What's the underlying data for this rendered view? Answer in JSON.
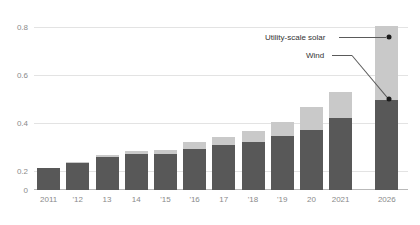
{
  "chart_data": {
    "type": "bar",
    "stacked": true,
    "title": "",
    "subtitle": "",
    "xlabel": "",
    "ylabel": "",
    "ylim": [
      0,
      0.9
    ],
    "yticks": [
      0,
      0.2,
      0.4,
      0.6,
      0.8
    ],
    "ytick_labels": [
      "0",
      "0.2",
      "0.4",
      "0.6",
      "0.8"
    ],
    "gridlines": [
      0.2,
      0.4,
      0.6,
      0.8
    ],
    "grid": true,
    "legend_position": "annotated-callouts",
    "categories": [
      "2011",
      "'12",
      "13",
      "14",
      "'15",
      "'16",
      "17",
      "'18",
      "'19",
      "20",
      "2021",
      "2026"
    ],
    "series": [
      {
        "name": "Wind",
        "color": "#585858",
        "values": [
          0.115,
          0.142,
          0.172,
          0.187,
          0.186,
          0.213,
          0.233,
          0.25,
          0.283,
          0.31,
          0.375,
          0.47
        ]
      },
      {
        "name": "Utility-scale solar",
        "color": "#c9c9c9",
        "values": [
          0.002,
          0.004,
          0.01,
          0.014,
          0.021,
          0.037,
          0.045,
          0.058,
          0.073,
          0.122,
          0.135,
          0.385
        ]
      }
    ],
    "totals": [
      0.117,
      0.146,
      0.182,
      0.201,
      0.207,
      0.25,
      0.278,
      0.308,
      0.356,
      0.432,
      0.51,
      0.855
    ],
    "annotations": [
      {
        "label": "Utility-scale solar",
        "series": "Utility-scale solar",
        "target_category": "2026",
        "target_value": 0.66
      },
      {
        "label": "Wind",
        "series": "Wind",
        "target_category": "2026",
        "target_value": 0.4
      }
    ],
    "forecast_category": "2026",
    "colors": {
      "wind": "#585858",
      "solar": "#c9c9c9",
      "grid": "#e3e3e3",
      "axis": "#b9b9b9",
      "tick_text": "#8a8a8a",
      "annotation_text": "#333333",
      "dot": "#1a1a1a"
    }
  }
}
